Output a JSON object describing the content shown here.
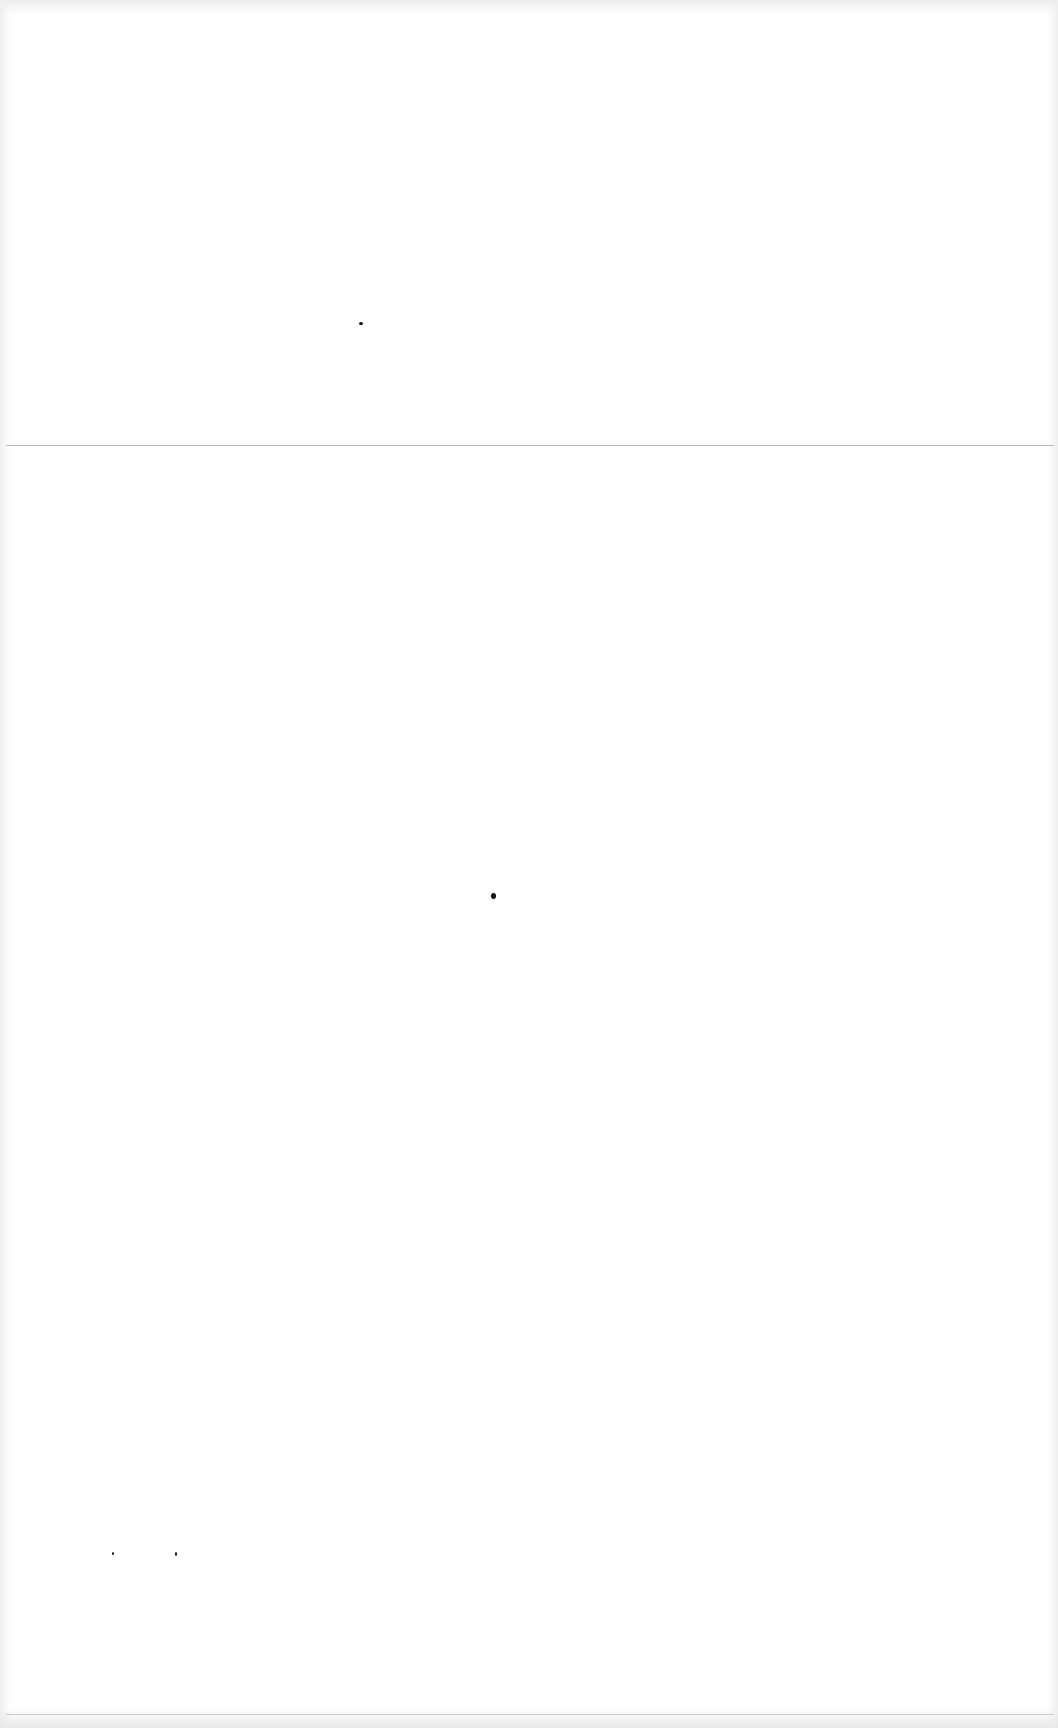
{
  "document": {
    "type": "blank-scanned-page",
    "text": "",
    "features": {
      "fold_line_y": 445,
      "bottom_edge_line_y": 1714
    },
    "specks": [
      {
        "x": 359,
        "y": 322,
        "w": 4,
        "h": 3
      },
      {
        "x": 491,
        "y": 893,
        "w": 5,
        "h": 6
      },
      {
        "x": 112,
        "y": 1552,
        "w": 2,
        "h": 3
      },
      {
        "x": 175,
        "y": 1552,
        "w": 2,
        "h": 4
      }
    ]
  }
}
